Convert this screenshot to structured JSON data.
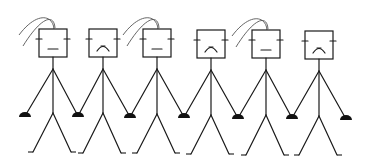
{
  "illustration": {
    "description": "Line drawing of six stick figures with square heads holding hands in a row",
    "background": "#ffffff",
    "stroke_color": "#1a1a1a",
    "figures": [
      {
        "cx": 53,
        "head_top": 29,
        "shoulder_y": 69,
        "hip_y": 113,
        "foot_y": 152,
        "face": "neutral",
        "hair": true
      },
      {
        "cx": 103,
        "head_top": 29,
        "shoulder_y": 69,
        "hip_y": 113,
        "foot_y": 153,
        "face": "frown",
        "hair": false
      },
      {
        "cx": 157,
        "head_top": 29,
        "shoulder_y": 69,
        "hip_y": 114,
        "foot_y": 153,
        "face": "neutral",
        "hair": true
      },
      {
        "cx": 211,
        "head_top": 30,
        "shoulder_y": 70,
        "hip_y": 115,
        "foot_y": 154,
        "face": "frown",
        "hair": false
      },
      {
        "cx": 266,
        "head_top": 30,
        "shoulder_y": 70,
        "hip_y": 115,
        "foot_y": 155,
        "face": "neutral",
        "hair": true
      },
      {
        "cx": 319,
        "head_top": 31,
        "shoulder_y": 71,
        "hip_y": 116,
        "foot_y": 155,
        "face": "frown",
        "hair": false
      }
    ],
    "hands": [
      {
        "x": 25,
        "y": 116
      },
      {
        "x": 78,
        "y": 116
      },
      {
        "x": 130,
        "y": 117
      },
      {
        "x": 184,
        "y": 117
      },
      {
        "x": 238,
        "y": 118
      },
      {
        "x": 292,
        "y": 118
      },
      {
        "x": 346,
        "y": 119
      }
    ]
  }
}
